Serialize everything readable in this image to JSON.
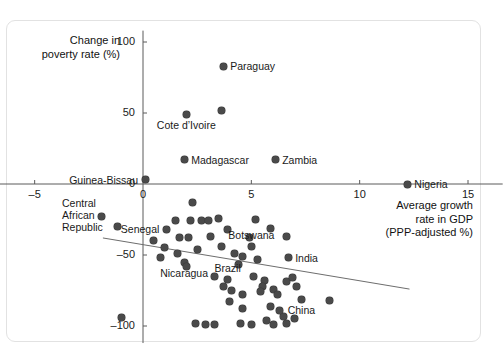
{
  "card": {
    "bg": "#ffffff",
    "border": "#e2e2e2"
  },
  "chart_data": {
    "type": "scatter",
    "title": "",
    "ylabel_line1": "Change in",
    "ylabel_line2": "poverty rate (%)",
    "xlabel_line1": "Average growth",
    "xlabel_line2": "rate in GDP",
    "xlabel_line3": "(PPP-adjusted %)",
    "xlabel": "Average growth rate in GDP (PPP-adjusted %)",
    "ylabel": "Change in poverty rate (%)",
    "xlim": [
      -6.6,
      16.6
    ],
    "ylim": [
      -112,
      108
    ],
    "xticks": [
      -5,
      0,
      5,
      10,
      15
    ],
    "yticks": [
      -100,
      -50,
      0,
      50,
      100
    ],
    "xtick_labels": [
      "–5",
      "0",
      "5",
      "10",
      "15"
    ],
    "ytick_labels": [
      "–100",
      "–50",
      "0",
      "50",
      "100"
    ],
    "grid": false,
    "legend": "none",
    "point_color": "#4a4a4a",
    "trendline": {
      "x0": -1.85,
      "y0": -38,
      "x1": 12.3,
      "y1": -74,
      "color": "#6d6d6d"
    },
    "points": [
      {
        "label": "Paraguay",
        "x": 3.7,
        "y": 83,
        "label_pos": "right"
      },
      {
        "label": "",
        "x": 3.6,
        "y": 52,
        "label_pos": "none"
      },
      {
        "label": "Cote d’Ivoire",
        "x": 2.0,
        "y": 49,
        "label_pos": "below"
      },
      {
        "label": "Madagascar",
        "x": 1.9,
        "y": 17,
        "label_pos": "right"
      },
      {
        "label": "Zambia",
        "x": 6.1,
        "y": 17,
        "label_pos": "right"
      },
      {
        "label": "Guinea-Bissau",
        "x": 0.1,
        "y": 3,
        "label_pos": "left"
      },
      {
        "label": "Nigeria",
        "x": 12.2,
        "y": 0,
        "label_pos": "right"
      },
      {
        "label": "Central African Republic",
        "x": -1.9,
        "y": -23,
        "label_pos": "left"
      },
      {
        "label": "",
        "x": -1.2,
        "y": -30,
        "label_pos": "none"
      },
      {
        "label": "",
        "x": -1.0,
        "y": -94,
        "label_pos": "none"
      },
      {
        "label": "Senegal",
        "x": 1.1,
        "y": -32,
        "label_pos": "left"
      },
      {
        "label": "",
        "x": 0.5,
        "y": -40,
        "label_pos": "none"
      },
      {
        "label": "",
        "x": 1.0,
        "y": -45,
        "label_pos": "none"
      },
      {
        "label": "",
        "x": 0.8,
        "y": -52,
        "label_pos": "none"
      },
      {
        "label": "",
        "x": 1.5,
        "y": -26,
        "label_pos": "none"
      },
      {
        "label": "",
        "x": 1.7,
        "y": -38,
        "label_pos": "none"
      },
      {
        "label": "",
        "x": 1.6,
        "y": -49,
        "label_pos": "none"
      },
      {
        "label": "Nicaragua",
        "x": 1.9,
        "y": -55,
        "label_pos": "below"
      },
      {
        "label": "",
        "x": 2.0,
        "y": -58,
        "label_pos": "none"
      },
      {
        "label": "",
        "x": 2.3,
        "y": -13,
        "label_pos": "none"
      },
      {
        "label": "",
        "x": 2.2,
        "y": -26,
        "label_pos": "none"
      },
      {
        "label": "",
        "x": 2.1,
        "y": -38,
        "label_pos": "none"
      },
      {
        "label": "",
        "x": 2.5,
        "y": -46,
        "label_pos": "none"
      },
      {
        "label": "",
        "x": 2.7,
        "y": -26,
        "label_pos": "none"
      },
      {
        "label": "",
        "x": 3.0,
        "y": -26,
        "label_pos": "none"
      },
      {
        "label": "",
        "x": 3.1,
        "y": -37,
        "label_pos": "none"
      },
      {
        "label": "",
        "x": 3.5,
        "y": -24,
        "label_pos": "none"
      },
      {
        "label": "",
        "x": 3.6,
        "y": -44,
        "label_pos": "none"
      },
      {
        "label": "",
        "x": 3.9,
        "y": -32,
        "label_pos": "none"
      },
      {
        "label": "",
        "x": 4.2,
        "y": -49,
        "label_pos": "none"
      },
      {
        "label": "",
        "x": 4.4,
        "y": -57,
        "label_pos": "none"
      },
      {
        "label": "",
        "x": 4.6,
        "y": -51,
        "label_pos": "none"
      },
      {
        "label": "",
        "x": 4.9,
        "y": -38,
        "label_pos": "none"
      },
      {
        "label": "Botswana",
        "x": 5.0,
        "y": -44,
        "label_pos": "above"
      },
      {
        "label": "",
        "x": 5.2,
        "y": -25,
        "label_pos": "none"
      },
      {
        "label": "",
        "x": 5.3,
        "y": -53,
        "label_pos": "none"
      },
      {
        "label": "",
        "x": 5.9,
        "y": -31,
        "label_pos": "none"
      },
      {
        "label": "",
        "x": 6.6,
        "y": -37,
        "label_pos": "none"
      },
      {
        "label": "India",
        "x": 6.7,
        "y": -52,
        "label_pos": "right"
      },
      {
        "label": "",
        "x": 3.3,
        "y": -65,
        "label_pos": "none"
      },
      {
        "label": "Brazil",
        "x": 3.9,
        "y": -67,
        "label_pos": "above"
      },
      {
        "label": "",
        "x": 3.7,
        "y": -72,
        "label_pos": "none"
      },
      {
        "label": "",
        "x": 4.1,
        "y": -75,
        "label_pos": "none"
      },
      {
        "label": "",
        "x": 4.6,
        "y": -78,
        "label_pos": "none"
      },
      {
        "label": "",
        "x": 4.0,
        "y": -83,
        "label_pos": "none"
      },
      {
        "label": "",
        "x": 4.6,
        "y": -88,
        "label_pos": "none"
      },
      {
        "label": "",
        "x": 5.1,
        "y": -65,
        "label_pos": "none"
      },
      {
        "label": "",
        "x": 5.6,
        "y": -68,
        "label_pos": "none"
      },
      {
        "label": "",
        "x": 5.5,
        "y": -72,
        "label_pos": "none"
      },
      {
        "label": "",
        "x": 5.4,
        "y": -76,
        "label_pos": "none"
      },
      {
        "label": "",
        "x": 6.0,
        "y": -74,
        "label_pos": "none"
      },
      {
        "label": "",
        "x": 6.2,
        "y": -78,
        "label_pos": "none"
      },
      {
        "label": "",
        "x": 6.6,
        "y": -69,
        "label_pos": "none"
      },
      {
        "label": "",
        "x": 6.9,
        "y": -66,
        "label_pos": "none"
      },
      {
        "label": "",
        "x": 7.1,
        "y": -72,
        "label_pos": "none"
      },
      {
        "label": "China",
        "x": 7.3,
        "y": -81,
        "label_pos": "below"
      },
      {
        "label": "",
        "x": 8.6,
        "y": -82,
        "label_pos": "none"
      },
      {
        "label": "",
        "x": 2.4,
        "y": -98,
        "label_pos": "none"
      },
      {
        "label": "",
        "x": 2.9,
        "y": -99,
        "label_pos": "none"
      },
      {
        "label": "",
        "x": 3.3,
        "y": -99,
        "label_pos": "none"
      },
      {
        "label": "",
        "x": 4.5,
        "y": -98,
        "label_pos": "none"
      },
      {
        "label": "",
        "x": 5.0,
        "y": -99,
        "label_pos": "none"
      },
      {
        "label": "",
        "x": 5.7,
        "y": -96,
        "label_pos": "none"
      },
      {
        "label": "",
        "x": 6.0,
        "y": -99,
        "label_pos": "none"
      },
      {
        "label": "",
        "x": 6.5,
        "y": -93,
        "label_pos": "none"
      },
      {
        "label": "",
        "x": 6.6,
        "y": -98,
        "label_pos": "none"
      },
      {
        "label": "",
        "x": 7.0,
        "y": -95,
        "label_pos": "none"
      },
      {
        "label": "",
        "x": 5.9,
        "y": -86,
        "label_pos": "none"
      },
      {
        "label": "",
        "x": 6.3,
        "y": -89,
        "label_pos": "none"
      }
    ],
    "callout_labels": [
      {
        "text": "Central",
        "x_px": 62,
        "y_px": 197
      },
      {
        "text": "African",
        "x_px": 62,
        "y_px": 209
      },
      {
        "text": "Republic",
        "x_px": 62,
        "y_px": 221
      }
    ]
  }
}
